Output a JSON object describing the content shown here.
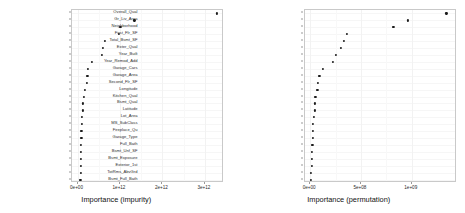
{
  "figure": {
    "panels": [
      {
        "id": "impurity",
        "xlabel": "Importance (impurity)",
        "xticks": [
          "0e+00",
          "1e+12",
          "2e+12",
          "3e+12"
        ]
      },
      {
        "id": "permutation",
        "xlabel": "Importance (permutation)",
        "xticks": [
          "0e+00",
          "5e+08",
          "1e+09"
        ]
      }
    ]
  },
  "chart_data": [
    {
      "type": "scatter",
      "title": "",
      "xlabel": "Importance (impurity)",
      "ylabel": "",
      "xlim": [
        -130000000000.0,
        3450000000000.0
      ],
      "xticks": [
        0,
        1000000000000,
        2000000000000,
        3000000000000
      ],
      "xticklabels": [
        "0e+00",
        "1e+12",
        "2e+12",
        "3e+12"
      ],
      "grid": true,
      "legend": "none",
      "categories": [
        "Overall_Qual",
        "Neighborhood",
        "Exter_Qual",
        "Gr_Liv_Area",
        "First_Flr_SF",
        "Garage_Cars",
        "Total_Bsmt_SF",
        "Year_Built",
        "Garage_Area",
        "Bsmt_Qual",
        "Second_Flr_SF",
        "Kitchen_Qual",
        "Lot_Area",
        "Full_Bath",
        "Year_Remod_Add",
        "Latitude",
        "Bsmt_Unf_SF",
        "Longitude",
        "Mas_Vnr_Area",
        "MS_SubClass",
        "TotRms_AbvGrd",
        "Fireplace_Qu",
        "Lot_Frontage",
        "Fireplaces",
        "Bsmt_Exposure"
      ],
      "values": [
        3280000000000,
        1340000000000,
        1010000000000,
        980000000000,
        640000000000,
        600000000000,
        570000000000,
        330000000000,
        245000000000,
        235000000000,
        225000000000,
        175000000000,
        150000000000,
        130000000000,
        120000000000,
        100000000000,
        97000000000,
        93000000000,
        90000000000,
        86000000000,
        84000000000,
        80000000000,
        78000000000,
        74000000000,
        70000000000
      ]
    },
    {
      "type": "scatter",
      "title": "",
      "xlabel": "Importance (permutation)",
      "ylabel": "",
      "xlim": [
        -55000000.0,
        1440000000.0
      ],
      "xticks": [
        0,
        500000000,
        1000000000
      ],
      "xticklabels": [
        "0e+00",
        "5e+08",
        "1e+09"
      ],
      "grid": true,
      "legend": "none",
      "categories": [
        "Overall_Qual",
        "Gr_Liv_Area",
        "Neighborhood",
        "First_Flr_SF",
        "Total_Bsmt_SF",
        "Exter_Qual",
        "Year_Built",
        "Year_Remod_Add",
        "Garage_Cars",
        "Garage_Area",
        "Second_Flr_SF",
        "Longitude",
        "Kitchen_Qual",
        "Bsmt_Qual",
        "Latitude",
        "Lot_Area",
        "MS_SubClass",
        "Fireplace_Qu",
        "Garage_Type",
        "Full_Bath",
        "Bsmt_Unf_SF",
        "Bsmt_Exposure",
        "Exterior_1st",
        "TotRms_AbvGrd",
        "Bsmt_Full_Bath"
      ],
      "values": [
        1340000000,
        960000000,
        820000000,
        360000000,
        330000000,
        300000000,
        255000000,
        225000000,
        125000000,
        92000000,
        78000000,
        72000000,
        52000000,
        48000000,
        44000000,
        38000000,
        30000000,
        26000000,
        24000000,
        22000000,
        18000000,
        16000000,
        14000000,
        12000000,
        10000000
      ]
    }
  ]
}
